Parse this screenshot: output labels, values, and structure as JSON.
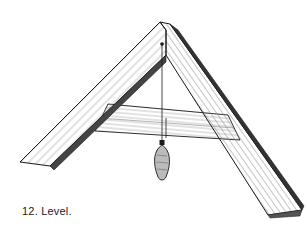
{
  "figure": {
    "caption": "12. Level.",
    "colors": {
      "ink": "#1a1a1a",
      "paper": "#ffffff",
      "shade": "#555555"
    }
  }
}
